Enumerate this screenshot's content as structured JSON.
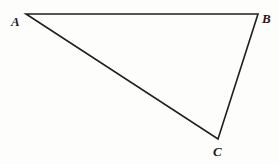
{
  "figure": {
    "type": "geometry-diagram",
    "shape": "triangle",
    "background_color": "#fdfdfc",
    "stroke_color": "#1f1f1f",
    "stroke_width": 1.6,
    "canvas": {
      "width": 279,
      "height": 164
    },
    "vertices": [
      {
        "id": "A",
        "label": "A",
        "x": 26,
        "y": 14,
        "label_x": 11,
        "label_y": 15
      },
      {
        "id": "B",
        "label": "B",
        "x": 258,
        "y": 14,
        "label_x": 262,
        "label_y": 12
      },
      {
        "id": "C",
        "label": "C",
        "x": 218,
        "y": 139,
        "label_x": 213,
        "label_y": 145
      }
    ],
    "edges": [
      {
        "id": "AB",
        "from": "A",
        "to": "B"
      },
      {
        "id": "BC",
        "from": "B",
        "to": "C"
      },
      {
        "id": "CA",
        "from": "C",
        "to": "A"
      }
    ],
    "path": "M 26 14 L 258 14 L 218 139 Z"
  }
}
